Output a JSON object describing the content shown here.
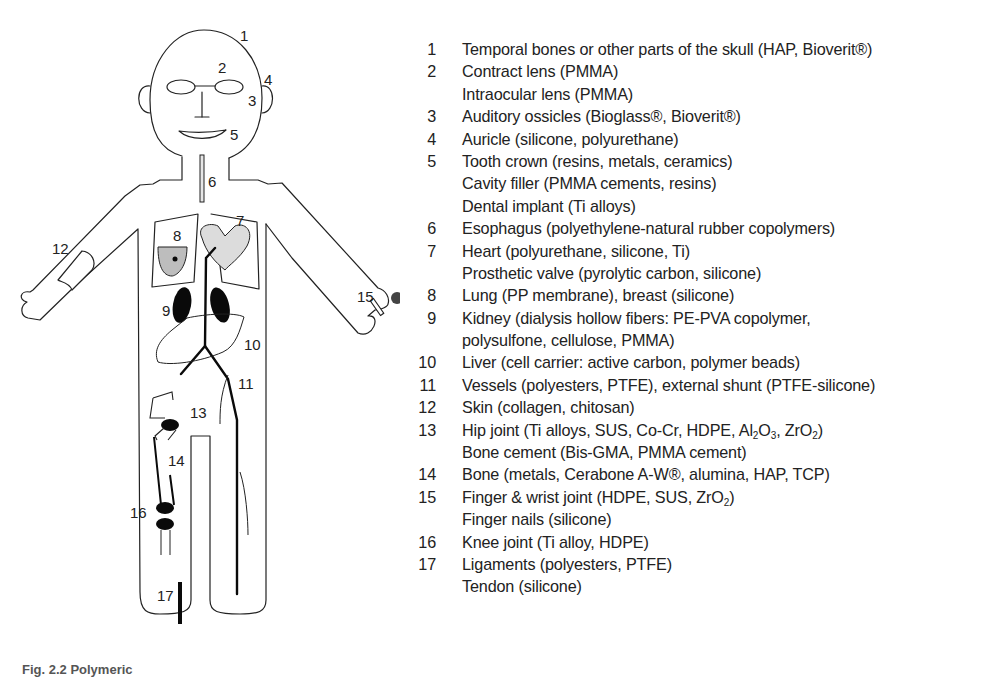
{
  "figure": {
    "caption": "Fig. 2.2  Polymeric",
    "diagram_labels": {
      "1": "1",
      "2": "2",
      "3": "3",
      "4": "4",
      "5": "5",
      "6": "6",
      "7": "7",
      "8": "8",
      "9": "9",
      "10": "10",
      "11": "11",
      "12": "12",
      "13": "13",
      "14": "14",
      "15": "15",
      "16": "16",
      "17": "17"
    },
    "colors": {
      "outline": "#222222",
      "organ_gray": "#d9d9d9",
      "lung_gray": "#bdbdbd",
      "solid_black": "#0a0a0a"
    }
  },
  "legend": [
    {
      "num": "1",
      "text": "Temporal bones or other parts of the skull (HAP, Bioverit®)"
    },
    {
      "num": "2",
      "text": "Contract lens (PMMA)"
    },
    {
      "num": "",
      "text": "Intraocular lens (PMMA)"
    },
    {
      "num": "3",
      "text": "Auditory ossicles (Bioglass®, Bioverit®)"
    },
    {
      "num": "4",
      "text": "Auricle (silicone, polyurethane)"
    },
    {
      "num": "5",
      "text": "Tooth crown (resins, metals, ceramics)"
    },
    {
      "num": "",
      "text": "Cavity filler (PMMA cements, resins)"
    },
    {
      "num": "",
      "text": "Dental implant (Ti alloys)"
    },
    {
      "num": "6",
      "text": "Esophagus (polyethylene-natural rubber copolymers)"
    },
    {
      "num": "7",
      "text": "Heart (polyurethane, silicone, Ti)"
    },
    {
      "num": "",
      "text": "Prosthetic valve (pyrolytic carbon, silicone)"
    },
    {
      "num": "8",
      "text": "Lung (PP membrane), breast (silicone)"
    },
    {
      "num": "9",
      "text": "Kidney (dialysis hollow fibers: PE-PVA copolymer,"
    },
    {
      "num": "",
      "text": "polysulfone, cellulose, PMMA)"
    },
    {
      "num": "10",
      "text": "Liver (cell carrier: active carbon, polymer beads)"
    },
    {
      "num": "11",
      "text": "Vessels (polyesters, PTFE), external shunt (PTFE-silicone)"
    },
    {
      "num": "12",
      "text": "Skin (collagen, chitosan)"
    },
    {
      "num": "13",
      "text_parts": [
        "Hip joint (Ti alloys, SUS, Co-Cr, HDPE, Al",
        "2",
        "O",
        "3",
        ", ZrO",
        "2",
        ")"
      ]
    },
    {
      "num": "",
      "text": "Bone cement (Bis-GMA, PMMA cement)"
    },
    {
      "num": "14",
      "text": "Bone (metals, Cerabone A-W®, alumina, HAP, TCP)"
    },
    {
      "num": "15",
      "text_parts": [
        "Finger & wrist joint (HDPE, SUS, ZrO",
        "2",
        ")"
      ]
    },
    {
      "num": "",
      "text": "Finger nails (silicone)"
    },
    {
      "num": "16",
      "text": "Knee joint (Ti alloy, HDPE)"
    },
    {
      "num": "17",
      "text": "Ligaments (polyesters, PTFE)"
    },
    {
      "num": "",
      "text": "Tendon (silicone)"
    }
  ]
}
